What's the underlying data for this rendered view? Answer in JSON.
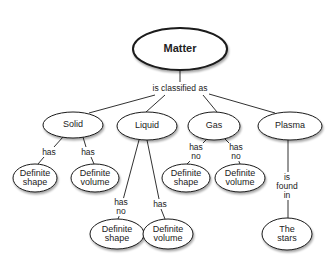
{
  "diagram": {
    "type": "concept-map",
    "root": {
      "id": "matter",
      "label": "Matter",
      "cx": 180,
      "cy": 49,
      "rx": 47,
      "ry": 21
    },
    "root_link_label": {
      "text": "is classified as",
      "x": 180,
      "y": 88
    },
    "nodes": [
      {
        "id": "solid",
        "label": "Solid",
        "cx": 73,
        "cy": 125,
        "rx": 30,
        "ry": 13
      },
      {
        "id": "liquid",
        "label": "Liquid",
        "cx": 147,
        "cy": 126,
        "rx": 30,
        "ry": 14
      },
      {
        "id": "gas",
        "label": "Gas",
        "cx": 214,
        "cy": 126,
        "rx": 26,
        "ry": 14
      },
      {
        "id": "plasma",
        "label": "Plasma",
        "cx": 290,
        "cy": 126,
        "rx": 32,
        "ry": 14
      },
      {
        "id": "solid-shape",
        "label": "Definite\nshape",
        "cx": 35,
        "cy": 178,
        "rx": 22,
        "ry": 14
      },
      {
        "id": "solid-volume",
        "label": "Definite\nvolume",
        "cx": 95,
        "cy": 178,
        "rx": 24,
        "ry": 14
      },
      {
        "id": "gas-shape",
        "label": "Definite\nshape",
        "cx": 186,
        "cy": 178,
        "rx": 24,
        "ry": 14
      },
      {
        "id": "gas-volume",
        "label": "Definite\nvolume",
        "cx": 240,
        "cy": 178,
        "rx": 25,
        "ry": 14
      },
      {
        "id": "liquid-shape",
        "label": "Definite\nshape",
        "cx": 117,
        "cy": 234,
        "rx": 27,
        "ry": 15
      },
      {
        "id": "liquid-volume",
        "label": "Definite\nvolume",
        "cx": 168,
        "cy": 234,
        "rx": 25,
        "ry": 15
      },
      {
        "id": "stars",
        "label": "The\nstars",
        "cx": 287,
        "cy": 234,
        "rx": 25,
        "ry": 16
      }
    ],
    "link_labels": [
      {
        "id": "solid-has-1",
        "text": "has",
        "x": 49,
        "y": 152
      },
      {
        "id": "solid-has-2",
        "text": "has",
        "x": 88,
        "y": 152
      },
      {
        "id": "gas-hasno-1",
        "text": "has\nno",
        "x": 196,
        "y": 152
      },
      {
        "id": "gas-hasno-2",
        "text": "has\nno",
        "x": 236,
        "y": 152
      },
      {
        "id": "liquid-hasno",
        "text": "has\nno",
        "x": 121,
        "y": 207
      },
      {
        "id": "liquid-has",
        "text": "has",
        "x": 160,
        "y": 204
      },
      {
        "id": "plasma-found",
        "text": "is\nfound\nin",
        "x": 287,
        "y": 186
      }
    ],
    "edges": [
      {
        "x1": 180,
        "y1": 70,
        "x2": 180,
        "y2": 82
      },
      {
        "x1": 155,
        "y1": 95,
        "x2": 89,
        "y2": 113
      },
      {
        "x1": 165,
        "y1": 95,
        "x2": 146,
        "y2": 112
      },
      {
        "x1": 203,
        "y1": 95,
        "x2": 217,
        "y2": 112
      },
      {
        "x1": 209,
        "y1": 94,
        "x2": 275,
        "y2": 113
      },
      {
        "x1": 63,
        "y1": 137,
        "x2": 54,
        "y2": 147
      },
      {
        "x1": 44,
        "y1": 157,
        "x2": 38,
        "y2": 164
      },
      {
        "x1": 83,
        "y1": 137,
        "x2": 86,
        "y2": 147
      },
      {
        "x1": 91,
        "y1": 157,
        "x2": 94,
        "y2": 164
      },
      {
        "x1": 207,
        "y1": 139,
        "x2": 200,
        "y2": 146
      },
      {
        "x1": 192,
        "y1": 159,
        "x2": 187,
        "y2": 164
      },
      {
        "x1": 225,
        "y1": 139,
        "x2": 232,
        "y2": 146
      },
      {
        "x1": 238,
        "y1": 159,
        "x2": 240,
        "y2": 164
      },
      {
        "x1": 139,
        "y1": 140,
        "x2": 123,
        "y2": 200
      },
      {
        "x1": 120,
        "y1": 214,
        "x2": 118,
        "y2": 219
      },
      {
        "x1": 147,
        "y1": 140,
        "x2": 159,
        "y2": 199
      },
      {
        "x1": 161,
        "y1": 209,
        "x2": 165,
        "y2": 219
      },
      {
        "x1": 288,
        "y1": 140,
        "x2": 288,
        "y2": 172
      },
      {
        "x1": 288,
        "y1": 200,
        "x2": 288,
        "y2": 218
      }
    ],
    "colors": {
      "stroke": "#1a1a1a",
      "fill": "#ffffff",
      "text": "#222222",
      "shadow": "#bbbbbb"
    }
  }
}
